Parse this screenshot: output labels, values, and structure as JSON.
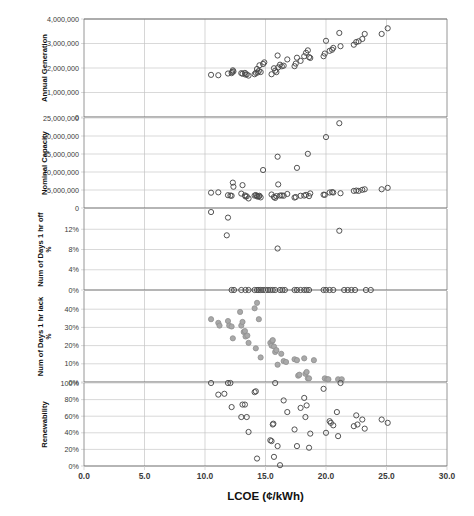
{
  "chart_data": {
    "type": "scatter",
    "title": "",
    "xlabel": "LCOE (¢/kWh)",
    "xlim": [
      0,
      30
    ],
    "xticks": [
      "0.0",
      "5.0",
      "10.0",
      "15.0",
      "20.0",
      "25.0",
      "30.0"
    ],
    "xtickvalues": [
      0,
      5,
      10,
      15,
      20,
      25,
      30
    ],
    "grid": true,
    "legend": "none",
    "panels": [
      {
        "ylabel": "Annual Generation",
        "ylabel_sub": "",
        "ylim": [
          0,
          4000000
        ],
        "yticks": [
          "0",
          "1,000,000",
          "2,000,000",
          "3,000,000",
          "4,000,000"
        ],
        "ytickvalues": [
          0,
          1000000,
          2000000,
          3000000,
          4000000
        ],
        "marker": "open-circle",
        "points": [
          [
            10.5,
            1720000
          ],
          [
            11.1,
            1705000
          ],
          [
            11.9,
            1775000
          ],
          [
            12.2,
            1790000
          ],
          [
            12.25,
            1835000
          ],
          [
            12.3,
            1905000
          ],
          [
            12.35,
            1860000
          ],
          [
            13.0,
            1790000
          ],
          [
            13.1,
            1765000
          ],
          [
            13.3,
            1800000
          ],
          [
            13.35,
            1730000
          ],
          [
            13.45,
            1740000
          ],
          [
            13.6,
            1690000
          ],
          [
            14.1,
            1745000
          ],
          [
            14.2,
            1800000
          ],
          [
            14.3,
            1960000
          ],
          [
            14.35,
            1815000
          ],
          [
            14.45,
            1880000
          ],
          [
            14.5,
            2110000
          ],
          [
            14.6,
            1835000
          ],
          [
            14.8,
            2165000
          ],
          [
            14.9,
            2230000
          ],
          [
            15.5,
            1745000
          ],
          [
            15.7,
            1990000
          ],
          [
            15.8,
            1890000
          ],
          [
            15.9,
            1830000
          ],
          [
            16.0,
            2510000
          ],
          [
            16.05,
            2025000
          ],
          [
            16.2,
            2135000
          ],
          [
            16.35,
            2070000
          ],
          [
            16.5,
            2095000
          ],
          [
            16.8,
            2350000
          ],
          [
            17.4,
            2075000
          ],
          [
            17.5,
            2180000
          ],
          [
            17.6,
            2420000
          ],
          [
            17.9,
            2290000
          ],
          [
            18.2,
            2480000
          ],
          [
            18.35,
            2620000
          ],
          [
            18.5,
            2720000
          ],
          [
            18.6,
            2445000
          ],
          [
            18.7,
            2410000
          ],
          [
            19.8,
            2480000
          ],
          [
            19.9,
            2590000
          ],
          [
            20.0,
            3110000
          ],
          [
            20.3,
            2700000
          ],
          [
            20.5,
            2745000
          ],
          [
            20.6,
            2820000
          ],
          [
            21.1,
            3430000
          ],
          [
            21.2,
            2890000
          ],
          [
            22.3,
            2950000
          ],
          [
            22.5,
            3060000
          ],
          [
            22.7,
            3090000
          ],
          [
            23.0,
            3185000
          ],
          [
            23.2,
            3390000
          ],
          [
            24.6,
            3390000
          ],
          [
            25.1,
            3620000
          ]
        ]
      },
      {
        "ylabel": "Nominal Capacity",
        "ylabel_sub": "",
        "ylim": [
          0,
          25000000
        ],
        "yticks": [
          "0",
          "5,000,000",
          "10,000,000",
          "15,000,000",
          "20,000,000",
          "25,000,000"
        ],
        "ytickvalues": [
          0,
          5000000,
          10000000,
          15000000,
          20000000,
          25000000
        ],
        "marker": "open-circle",
        "points": [
          [
            10.5,
            4250000
          ],
          [
            11.1,
            4350000
          ],
          [
            11.9,
            3550000
          ],
          [
            12.1,
            3450000
          ],
          [
            12.2,
            3400000
          ],
          [
            12.3,
            7050000
          ],
          [
            12.35,
            5900000
          ],
          [
            13.0,
            4000000
          ],
          [
            13.1,
            6350000
          ],
          [
            13.3,
            3500000
          ],
          [
            13.35,
            3200000
          ],
          [
            13.45,
            3250000
          ],
          [
            13.6,
            2650000
          ],
          [
            14.1,
            3450000
          ],
          [
            14.2,
            3600000
          ],
          [
            14.3,
            3350000
          ],
          [
            14.35,
            3150000
          ],
          [
            14.45,
            3250000
          ],
          [
            14.5,
            3400000
          ],
          [
            14.6,
            2950000
          ],
          [
            14.8,
            10550000
          ],
          [
            15.5,
            3750000
          ],
          [
            15.7,
            3050000
          ],
          [
            15.8,
            2800000
          ],
          [
            15.9,
            3300000
          ],
          [
            16.0,
            14250000
          ],
          [
            16.05,
            6550000
          ],
          [
            16.2,
            3450000
          ],
          [
            16.35,
            3500000
          ],
          [
            16.5,
            3400000
          ],
          [
            16.8,
            3900000
          ],
          [
            17.4,
            2900000
          ],
          [
            17.5,
            3050000
          ],
          [
            17.6,
            11150000
          ],
          [
            17.9,
            3400000
          ],
          [
            18.2,
            3450000
          ],
          [
            18.35,
            3650000
          ],
          [
            18.5,
            15050000
          ],
          [
            18.6,
            3300000
          ],
          [
            18.7,
            4050000
          ],
          [
            19.8,
            3700000
          ],
          [
            19.9,
            3650000
          ],
          [
            20.0,
            19700000
          ],
          [
            20.3,
            4300000
          ],
          [
            20.5,
            4400000
          ],
          [
            20.6,
            4300000
          ],
          [
            21.1,
            23550000
          ],
          [
            21.2,
            4100000
          ],
          [
            22.3,
            4750000
          ],
          [
            22.5,
            4850000
          ],
          [
            22.7,
            4750000
          ],
          [
            23.0,
            5050000
          ],
          [
            23.2,
            5200000
          ],
          [
            24.6,
            5200000
          ],
          [
            25.1,
            5600000
          ]
        ]
      },
      {
        "ylabel": "Num of Days 1 hr off",
        "ylabel_sub": "%",
        "ylim": [
          0,
          16
        ],
        "yticks": [
          "0%",
          "4%",
          "8%",
          "12%"
        ],
        "ytickvalues": [
          0,
          4,
          8,
          12
        ],
        "marker": "open-circle",
        "points": [
          [
            10.5,
            15.4
          ],
          [
            11.9,
            14.3
          ],
          [
            11.8,
            10.8
          ],
          [
            16.0,
            8.2
          ],
          [
            21.1,
            11.7
          ],
          [
            12.2,
            0
          ],
          [
            12.4,
            0
          ],
          [
            13.0,
            0
          ],
          [
            13.35,
            0
          ],
          [
            13.6,
            0
          ],
          [
            14.1,
            0
          ],
          [
            14.3,
            0
          ],
          [
            14.45,
            0
          ],
          [
            14.6,
            0
          ],
          [
            14.8,
            0
          ],
          [
            15.0,
            0
          ],
          [
            15.2,
            0
          ],
          [
            15.4,
            0
          ],
          [
            15.6,
            0
          ],
          [
            15.8,
            0
          ],
          [
            16.2,
            0
          ],
          [
            16.4,
            0
          ],
          [
            16.6,
            0
          ],
          [
            17.4,
            0
          ],
          [
            17.6,
            0
          ],
          [
            17.9,
            0
          ],
          [
            18.2,
            0
          ],
          [
            18.4,
            0
          ],
          [
            18.6,
            0
          ],
          [
            19.8,
            0
          ],
          [
            20.0,
            0
          ],
          [
            20.3,
            0
          ],
          [
            20.6,
            0
          ],
          [
            21.5,
            0
          ],
          [
            21.8,
            0
          ],
          [
            22.1,
            0
          ],
          [
            22.4,
            0
          ],
          [
            23.3,
            0
          ],
          [
            23.7,
            0
          ]
        ]
      },
      {
        "ylabel": "Num of Days 1 hr lack",
        "ylabel_sub": "%",
        "ylim": [
          0,
          50
        ],
        "yticks": [
          "0%",
          "10%",
          "20%",
          "30%",
          "40%"
        ],
        "ytickvalues": [
          0,
          10,
          20,
          30,
          40
        ],
        "marker": "gray-circle",
        "points": [
          [
            10.5,
            34.5
          ],
          [
            11.1,
            32.5
          ],
          [
            11.2,
            31.0
          ],
          [
            11.9,
            33.5
          ],
          [
            12.0,
            31.0
          ],
          [
            12.2,
            30.5
          ],
          [
            12.3,
            24.0
          ],
          [
            12.9,
            38.5
          ],
          [
            13.0,
            31.0
          ],
          [
            13.1,
            33.0
          ],
          [
            13.2,
            27.5
          ],
          [
            13.3,
            28.0
          ],
          [
            13.35,
            25.0
          ],
          [
            13.5,
            25.5
          ],
          [
            13.6,
            21.5
          ],
          [
            14.1,
            40.5
          ],
          [
            14.2,
            18.5
          ],
          [
            14.3,
            43.5
          ],
          [
            14.45,
            34.5
          ],
          [
            14.6,
            13.5
          ],
          [
            15.4,
            21.5
          ],
          [
            15.5,
            20.0
          ],
          [
            15.55,
            22.5
          ],
          [
            15.6,
            23.0
          ],
          [
            15.7,
            19.5
          ],
          [
            15.8,
            16.5
          ],
          [
            15.9,
            17.5
          ],
          [
            16.0,
            9.5
          ],
          [
            16.3,
            15.5
          ],
          [
            16.5,
            11.5
          ],
          [
            16.7,
            11.0
          ],
          [
            17.4,
            12.5
          ],
          [
            17.6,
            12.0
          ],
          [
            17.7,
            3.5
          ],
          [
            17.8,
            4.0
          ],
          [
            18.2,
            13.0
          ],
          [
            18.3,
            4.5
          ],
          [
            18.4,
            5.5
          ],
          [
            18.5,
            2.0
          ],
          [
            18.6,
            2.0
          ],
          [
            19.0,
            12.0
          ],
          [
            19.9,
            2.0
          ],
          [
            20.1,
            1.5
          ],
          [
            20.2,
            1.5
          ],
          [
            21.0,
            1.5
          ],
          [
            21.3,
            1.5
          ]
        ]
      },
      {
        "ylabel": "Renewability",
        "ylabel_sub": "",
        "ylim": [
          0,
          100
        ],
        "yticks": [
          "0%",
          "20%",
          "40%",
          "60%",
          "80%",
          "100%"
        ],
        "ytickvalues": [
          0,
          20,
          40,
          60,
          80,
          100
        ],
        "marker": "open-circle",
        "points": [
          [
            10.5,
            100
          ],
          [
            11.1,
            86
          ],
          [
            11.6,
            87
          ],
          [
            11.9,
            100
          ],
          [
            12.1,
            100
          ],
          [
            12.2,
            71
          ],
          [
            13.0,
            59
          ],
          [
            13.1,
            74
          ],
          [
            13.3,
            74
          ],
          [
            13.45,
            59
          ],
          [
            13.6,
            41
          ],
          [
            14.1,
            89
          ],
          [
            14.2,
            90
          ],
          [
            14.3,
            9
          ],
          [
            15.4,
            31
          ],
          [
            15.5,
            30
          ],
          [
            15.6,
            50
          ],
          [
            15.65,
            51
          ],
          [
            15.7,
            11
          ],
          [
            15.8,
            100
          ],
          [
            16.0,
            24
          ],
          [
            16.2,
            1
          ],
          [
            16.5,
            79
          ],
          [
            16.8,
            65
          ],
          [
            17.4,
            44
          ],
          [
            17.6,
            24
          ],
          [
            17.9,
            70
          ],
          [
            18.2,
            82
          ],
          [
            18.3,
            59
          ],
          [
            18.4,
            73
          ],
          [
            18.6,
            22
          ],
          [
            18.7,
            39
          ],
          [
            19.8,
            93
          ],
          [
            20.0,
            40
          ],
          [
            20.3,
            54
          ],
          [
            20.4,
            52
          ],
          [
            20.6,
            49
          ],
          [
            20.9,
            65
          ],
          [
            21.0,
            36
          ],
          [
            21.2,
            100
          ],
          [
            22.3,
            48
          ],
          [
            22.5,
            61
          ],
          [
            22.6,
            50
          ],
          [
            23.0,
            56
          ],
          [
            23.2,
            45
          ],
          [
            24.6,
            56
          ],
          [
            25.1,
            52
          ]
        ]
      }
    ]
  }
}
